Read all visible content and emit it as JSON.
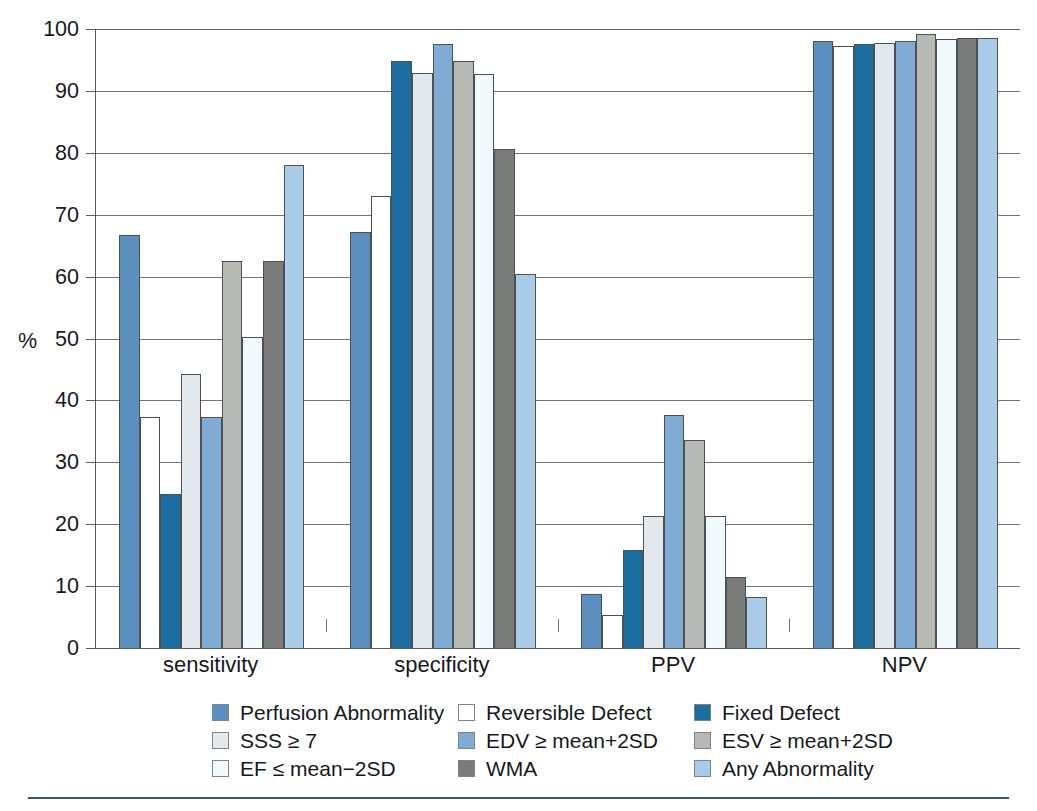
{
  "figure": {
    "y_axis_title": "%",
    "bottom_rule_color": "#3f545f"
  },
  "chart_data": {
    "type": "bar",
    "title": "",
    "xlabel": "",
    "ylabel": "%",
    "ylim": [
      0,
      100
    ],
    "ytick_labels": [
      "0",
      "10",
      "20",
      "30",
      "40",
      "50",
      "60",
      "70",
      "80",
      "90",
      "100"
    ],
    "ytick_values": [
      0,
      10,
      20,
      30,
      40,
      50,
      60,
      70,
      80,
      90,
      100
    ],
    "grid": true,
    "grid_axis": "y",
    "legend_position": "bottom",
    "legend_columns": 3,
    "categories": [
      "sensitivity",
      "specificity",
      "PPV",
      "NPV"
    ],
    "series": [
      {
        "name": "Perfusion Abnormality",
        "color": "#5b8fc0",
        "values": [
          66.7,
          67.2,
          8.7,
          98.1
        ]
      },
      {
        "name": "Reversible Defect",
        "color": "#ffffff",
        "values": [
          37.4,
          73.1,
          5.4,
          97.3
        ]
      },
      {
        "name": "Fixed Defect",
        "color": "#1a6ea0",
        "values": [
          24.9,
          94.8,
          15.8,
          97.5
        ]
      },
      {
        "name": "SSS ≥ 7",
        "color": "#e3e8ec",
        "values": [
          44.2,
          92.9,
          21.3,
          97.7
        ]
      },
      {
        "name": "EDV ≥ mean+2SD",
        "color": "#7fabd4",
        "values": [
          37.3,
          97.5,
          37.7,
          98.0
        ]
      },
      {
        "name": "ESV ≥ mean+2SD",
        "color": "#b7b9b5",
        "values": [
          62.5,
          94.9,
          33.6,
          99.2
        ]
      },
      {
        "name": "EF ≤ mean−2SD",
        "color": "#f2f9fc",
        "values": [
          50.2,
          92.8,
          21.3,
          98.4
        ]
      },
      {
        "name": "WMA",
        "color": "#787b77",
        "values": [
          62.5,
          80.6,
          11.4,
          98.6
        ]
      },
      {
        "name": "Any Abnormality",
        "color": "#a9cbe8",
        "values": [
          78.0,
          60.5,
          8.3,
          98.6
        ]
      }
    ]
  },
  "legend": {
    "rows": [
      [
        {
          "label": "Perfusion Abnormality",
          "color": "#5b8fc0"
        },
        {
          "label": "Reversible Defect",
          "color": "#ffffff"
        },
        {
          "label": "Fixed Defect",
          "color": "#1a6ea0"
        }
      ],
      [
        {
          "label": "SSS ≥ 7",
          "color": "#e3e8ec"
        },
        {
          "label": "EDV ≥ mean+2SD",
          "color": "#7fabd4"
        },
        {
          "label": "ESV ≥ mean+2SD",
          "color": "#b7b9b5"
        }
      ],
      [
        {
          "label": "EF ≤ mean−2SD",
          "color": "#f2f9fc"
        },
        {
          "label": "WMA",
          "color": "#787b77"
        },
        {
          "label": "Any Abnormality",
          "color": "#a9cbe8"
        }
      ]
    ]
  }
}
